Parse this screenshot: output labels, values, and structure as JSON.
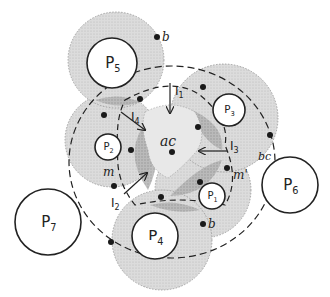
{
  "colors": {
    "ink": "#222222",
    "light_shade": "#d9d9d9",
    "mid_shade": "#c4c4c4",
    "dark_shade": "#a8a8a8",
    "center_shade": "#e3e3e3",
    "background": "#ffffff"
  },
  "processors": [
    {
      "id": "P1",
      "label": "P",
      "sub": "1",
      "cx": 212,
      "cy": 196,
      "r": 13,
      "shaded": true,
      "ring_cx": 203,
      "ring_cy": 190,
      "ring_r": 48
    },
    {
      "id": "P2",
      "label": "P",
      "sub": "2",
      "cx": 108,
      "cy": 147,
      "r": 13,
      "shaded": true,
      "ring_cx": 112,
      "ring_cy": 140,
      "ring_r": 47
    },
    {
      "id": "P3",
      "label": "P",
      "sub": "3",
      "cx": 229,
      "cy": 110,
      "r": 16,
      "shaded": true,
      "ring_cx": 224,
      "ring_cy": 118,
      "ring_r": 54
    },
    {
      "id": "P4",
      "label": "P",
      "sub": "4",
      "cx": 155,
      "cy": 236,
      "r": 23,
      "shaded": true,
      "ring_cx": 162,
      "ring_cy": 240,
      "ring_r": 50
    },
    {
      "id": "P5",
      "label": "P",
      "sub": "5",
      "cx": 112,
      "cy": 63,
      "r": 25,
      "shaded": true,
      "ring_cx": 116,
      "ring_cy": 60,
      "ring_r": 48
    },
    {
      "id": "P6",
      "label": "P",
      "sub": "6",
      "cx": 290,
      "cy": 185,
      "r": 28,
      "shaded": false
    },
    {
      "id": "P7",
      "label": "P",
      "sub": "7",
      "cx": 48,
      "cy": 222,
      "r": 33,
      "shaded": false
    }
  ],
  "labels": {
    "ac": {
      "text": "ac",
      "x": 160,
      "y": 146
    },
    "bc": {
      "text": "bc",
      "x": 258,
      "y": 160
    },
    "b_top": {
      "text": "b",
      "x": 162,
      "y": 41
    },
    "b_bottom": {
      "text": "b",
      "x": 208,
      "y": 228
    },
    "m": {
      "text": "m",
      "x": 103,
      "y": 176
    },
    "m_prime": {
      "text": "m'",
      "x": 233,
      "y": 179
    },
    "I1": {
      "text": "I",
      "sub": "1",
      "x": 175,
      "y": 95
    },
    "I2": {
      "text": "I",
      "sub": "2",
      "x": 111,
      "y": 207
    },
    "I3": {
      "text": "I",
      "sub": "3",
      "x": 230,
      "y": 150
    },
    "I4": {
      "text": "I",
      "sub": "4",
      "x": 131,
      "y": 121
    }
  },
  "dots": [
    {
      "name": "b-top-dot",
      "x": 157,
      "y": 37
    },
    {
      "name": "ac-dot",
      "x": 172,
      "y": 152
    },
    {
      "name": "dot-upper-left",
      "x": 140,
      "y": 99
    },
    {
      "name": "dot-left-upper",
      "x": 104,
      "y": 115
    },
    {
      "name": "dot-p2-right",
      "x": 131,
      "y": 150
    },
    {
      "name": "dot-m",
      "x": 114,
      "y": 186
    },
    {
      "name": "dot-top-right",
      "x": 203,
      "y": 87
    },
    {
      "name": "dot-p3-left",
      "x": 198,
      "y": 127
    },
    {
      "name": "dot-p3-right",
      "x": 270,
      "y": 135
    },
    {
      "name": "dot-m-prime",
      "x": 227,
      "y": 168
    },
    {
      "name": "dot-p1-left",
      "x": 200,
      "y": 182
    },
    {
      "name": "dot-lower-center",
      "x": 161,
      "y": 197
    },
    {
      "name": "dot-b-bottom",
      "x": 203,
      "y": 224
    },
    {
      "name": "dot-p4-left",
      "x": 111,
      "y": 242
    }
  ],
  "arrows": [
    {
      "name": "I1-arrow",
      "x1": 170,
      "y1": 83,
      "x2": 170,
      "y2": 113
    },
    {
      "name": "I2-arrow",
      "x1": 124,
      "y1": 194,
      "x2": 147,
      "y2": 173
    },
    {
      "name": "I3-arrow",
      "x1": 227,
      "y1": 151,
      "x2": 199,
      "y2": 151
    },
    {
      "name": "I4-arrow",
      "x1": 121,
      "y1": 112,
      "x2": 145,
      "y2": 130
    }
  ]
}
